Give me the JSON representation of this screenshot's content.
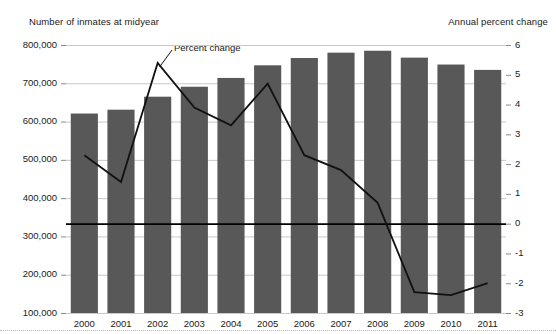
{
  "chart_data": {
    "type": "bar",
    "title": "",
    "subtitle": "",
    "left_axis_label": "Number of inmates at midyear",
    "right_axis_label": "Annual percent change",
    "xlabel": "",
    "categories": [
      "2000",
      "2001",
      "2002",
      "2003",
      "2004",
      "2005",
      "2006",
      "2007",
      "2008",
      "2009",
      "2010",
      "2011"
    ],
    "grid": true,
    "legend_position": "inline-annotation",
    "series": [
      {
        "name": "Number of inmates at midyear",
        "type": "bar",
        "axis": "left",
        "color": "#585858",
        "values": [
          621000,
          631000,
          665000,
          691000,
          714000,
          747000,
          766000,
          780000,
          785000,
          767000,
          749000,
          735000
        ]
      },
      {
        "name": "Percent change",
        "type": "line",
        "axis": "right",
        "color": "#111111",
        "values": [
          2.3,
          1.4,
          5.4,
          3.9,
          3.3,
          4.7,
          2.3,
          1.8,
          0.7,
          -2.3,
          -2.4,
          -2.0
        ]
      }
    ],
    "left_axis": {
      "ticks": [
        "800,000",
        "700,000",
        "600,000",
        "500,000",
        "400,000",
        "300,000",
        "200,000",
        "100,000"
      ],
      "values": [
        800000,
        700000,
        600000,
        500000,
        400000,
        300000,
        200000,
        100000
      ],
      "ylim": [
        100000,
        800000
      ]
    },
    "right_axis": {
      "ticks": [
        "6",
        "5",
        "4",
        "3",
        "2",
        "1",
        "0",
        "-1",
        "-2",
        "-3"
      ],
      "values": [
        6,
        5,
        4,
        3,
        2,
        1,
        0,
        -1,
        -2,
        -3
      ],
      "ylim": [
        -3,
        6
      ]
    },
    "annotations": [
      {
        "text": "Percent change",
        "target_series": "Percent change"
      }
    ]
  }
}
